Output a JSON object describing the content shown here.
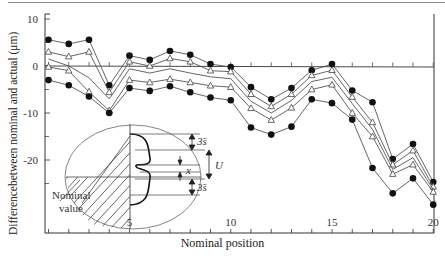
{
  "chart_data": {
    "type": "line",
    "title": "",
    "xlabel": "Nominal position",
    "ylabel": "Differencebetween nominal and actual (μm)",
    "x": [
      1,
      2,
      3,
      4,
      5,
      6,
      7,
      8,
      9,
      10,
      11,
      12,
      13,
      14,
      15,
      16,
      17,
      18,
      19,
      20
    ],
    "xticks_labeled": [
      5,
      10,
      15,
      20
    ],
    "yticks": [
      10,
      0,
      -10,
      -20
    ],
    "xlim": [
      1,
      20
    ],
    "ylim": [
      -27,
      12
    ],
    "grid": false,
    "reference_line": 0,
    "series": [
      {
        "name": "Upper limit (dot)",
        "marker": "dot",
        "values": [
          5.6,
          4.7,
          5.6,
          -4.1,
          2.2,
          1.3,
          3.2,
          2.4,
          0.4,
          -0.2,
          -4.5,
          -7.1,
          -4.7,
          -0.9,
          0.4,
          -5.2,
          -7.7,
          -19.8,
          -16.6,
          -24.7
        ]
      },
      {
        "name": "Upper 3s (triangle)",
        "marker": "triangle",
        "values": [
          3.0,
          2.0,
          3.0,
          -5.6,
          0.9,
          0.0,
          1.6,
          0.9,
          -1.0,
          -1.2,
          -6.0,
          -8.6,
          -6.0,
          -2.0,
          -0.9,
          -6.6,
          -12.0,
          -21.0,
          -18.0,
          -25.7
        ]
      },
      {
        "name": "Mean (line)",
        "marker": "none",
        "values": [
          1.5,
          0.0,
          -2.5,
          -7.0,
          -0.6,
          -1.5,
          -0.6,
          -1.5,
          -2.3,
          -2.7,
          -7.5,
          -10.0,
          -7.3,
          -3.3,
          -2.4,
          -8.0,
          -13.5,
          -22.0,
          -19.5,
          -26.3
        ]
      },
      {
        "name": "Lower 3s (triangle)",
        "marker": "triangle",
        "values": [
          -0.2,
          -1.0,
          -5.5,
          -9.5,
          -3.0,
          -3.5,
          -2.8,
          -3.5,
          -4.2,
          -4.5,
          -9.0,
          -11.5,
          -8.9,
          -5.0,
          -4.0,
          -10.0,
          -15.0,
          -23.0,
          -21.0,
          -26.8
        ]
      },
      {
        "name": "Lower limit (dot)",
        "marker": "dot",
        "values": [
          -3.0,
          -4.1,
          -6.5,
          -10.0,
          -4.7,
          -5.3,
          -4.3,
          -5.6,
          -6.7,
          -7.3,
          -13.1,
          -14.6,
          -12.9,
          -7.1,
          -7.9,
          -11.4,
          -21.7,
          -27.1,
          -23.9,
          -29.5
        ]
      }
    ],
    "inset": {
      "labels": [
        "3s̄",
        "U",
        "x",
        "3s̄"
      ],
      "annotation": "Nominal value"
    }
  },
  "labels": {
    "xlabel": "Nominal position",
    "ylabel": "Differencebetween nominal and actual (μm)",
    "nominal_value_line1": "Nominal",
    "nominal_value_line2": "value",
    "inset_3s_top": "3s̄",
    "inset_U": "U",
    "inset_x": "x",
    "inset_3s_bottom": "3s̄"
  }
}
